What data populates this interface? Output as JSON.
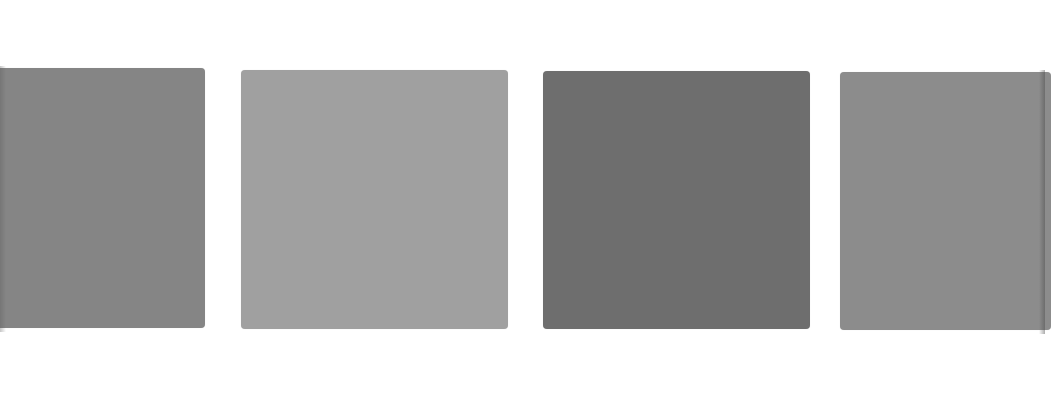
{
  "canvas": {
    "width": 1045,
    "height": 396,
    "background": "#ffffff"
  },
  "swatches": [
    {
      "id": "swatch-1",
      "color": "#858585",
      "x": -6,
      "y": 68,
      "width": 211,
      "height": 260
    },
    {
      "id": "swatch-2",
      "color": "#a0a0a0",
      "x": 241,
      "y": 70,
      "width": 267,
      "height": 259
    },
    {
      "id": "swatch-3",
      "color": "#6e6e6e",
      "x": 543,
      "y": 71,
      "width": 267,
      "height": 258
    },
    {
      "id": "swatch-4",
      "color": "#8c8c8c",
      "x": 840,
      "y": 72,
      "width": 211,
      "height": 258
    }
  ]
}
